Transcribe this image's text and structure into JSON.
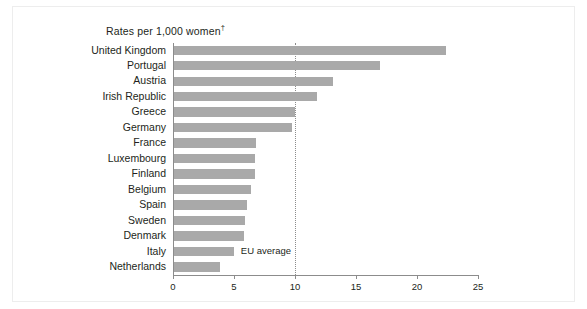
{
  "chart_data": {
    "type": "bar",
    "orientation": "horizontal",
    "title": "Rates per 1,000 women",
    "title_footnote_marker": "†",
    "xlabel": "",
    "ylabel": "",
    "xlim": [
      0,
      25
    ],
    "xticks": [
      0,
      5,
      10,
      15,
      20,
      25
    ],
    "xtick_labels": [
      "0",
      "5",
      "10",
      "15",
      "20",
      "25"
    ],
    "grid": false,
    "legend": "none",
    "bar_color": "#a9a9a9",
    "axis_color": "#8c8c8c",
    "categories": [
      "United Kingdom",
      "Portugal",
      "Austria",
      "Irish Republic",
      "Greece",
      "Germany",
      "France",
      "Luxembourg",
      "Finland",
      "Belgium",
      "Spain",
      "Sweden",
      "Denmark",
      "Italy",
      "Netherlands"
    ],
    "values": [
      22.3,
      16.9,
      13.0,
      11.7,
      9.9,
      9.7,
      6.7,
      6.6,
      6.6,
      6.3,
      6.0,
      5.8,
      5.7,
      4.9,
      3.8
    ],
    "annotations": [
      {
        "name": "eu-average",
        "label": "EU average",
        "value": 10,
        "style": "dotted-vertical-line"
      }
    ]
  }
}
